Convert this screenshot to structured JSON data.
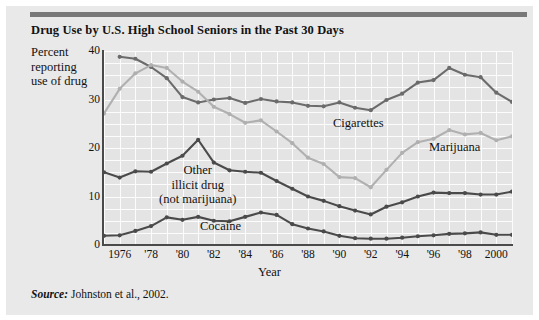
{
  "figure": {
    "title": "Drug Use by U.S. High School Seniors in the Past 30 Days",
    "source_word": "Source:",
    "source_text": " Johnston et al., 2002."
  },
  "axes": {
    "ylabel_line1": "Percent",
    "ylabel_line2": "reporting",
    "ylabel_line3": "use of drug",
    "xlabel": "Year"
  },
  "series_labels": {
    "cigarettes": "Cigarettes",
    "marijuana": "Marijuana",
    "cocaine": "Cocaine",
    "other_line1": "Other",
    "other_line2": "illicit drug",
    "other_line3": "(not marijuana)"
  },
  "colors": {
    "cigarettes": "#6b6b6b",
    "marijuana": "#b0b0b0",
    "other_illicit": "#4a4a4a",
    "cocaine": "#4a4a4a",
    "plot_background": "#e4e4e4",
    "gridline": "#fcfcfc",
    "axis": "#4a4a4a",
    "figure_background": "#e9e9e9",
    "top_rule": "#787878"
  },
  "chart_data": {
    "type": "line",
    "title": "Drug Use by U.S. High School Seniors in the Past 30 Days",
    "xlabel": "Year",
    "ylabel": "Percent reporting use of drug",
    "xlim": [
      1975,
      2001
    ],
    "ylim": [
      0,
      40
    ],
    "yticks": [
      0,
      10,
      20,
      30,
      40
    ],
    "xtick_labels": [
      "1976",
      "'78",
      "'80",
      "'82",
      "'84",
      "'86",
      "'88",
      "'90",
      "'92",
      "'94",
      "'96",
      "'98",
      "2000"
    ],
    "xtick_values": [
      1976,
      1978,
      1980,
      1982,
      1984,
      1986,
      1988,
      1990,
      1992,
      1994,
      1996,
      1998,
      2000
    ],
    "grid": true,
    "legend": "inline-annotations",
    "x": [
      1975,
      1976,
      1977,
      1978,
      1979,
      1980,
      1981,
      1982,
      1983,
      1984,
      1985,
      1986,
      1987,
      1988,
      1989,
      1990,
      1991,
      1992,
      1993,
      1994,
      1995,
      1996,
      1997,
      1998,
      1999,
      2000,
      2001
    ],
    "series": [
      {
        "name": "Cigarettes",
        "color": "#6b6b6b",
        "x": [
          1976,
          1977,
          1978,
          1979,
          1980,
          1981,
          1982,
          1983,
          1984,
          1985,
          1986,
          1987,
          1988,
          1989,
          1990,
          1991,
          1992,
          1993,
          1994,
          1995,
          1996,
          1997,
          1998,
          1999,
          2000,
          2001
        ],
        "values": [
          38.8,
          38.4,
          36.7,
          34.4,
          30.5,
          29.4,
          30.0,
          30.3,
          29.3,
          30.1,
          29.6,
          29.4,
          28.7,
          28.6,
          29.4,
          28.3,
          27.8,
          29.9,
          31.2,
          33.5,
          34.0,
          36.5,
          35.1,
          34.6,
          31.4,
          29.5
        ]
      },
      {
        "name": "Marijuana",
        "color": "#b0b0b0",
        "x": [
          1975,
          1976,
          1977,
          1978,
          1979,
          1980,
          1981,
          1982,
          1983,
          1984,
          1985,
          1986,
          1987,
          1988,
          1989,
          1990,
          1991,
          1992,
          1993,
          1994,
          1995,
          1996,
          1997,
          1998,
          1999,
          2000,
          2001
        ],
        "values": [
          27.1,
          32.2,
          35.4,
          37.1,
          36.5,
          33.7,
          31.6,
          28.5,
          27.0,
          25.2,
          25.7,
          23.4,
          21.0,
          18.0,
          16.7,
          14.0,
          13.8,
          11.9,
          15.5,
          19.0,
          21.2,
          21.9,
          23.7,
          22.8,
          23.1,
          21.6,
          22.4
        ]
      },
      {
        "name": "Other illicit drug (not marijuana)",
        "color": "#4a4a4a",
        "x": [
          1975,
          1976,
          1977,
          1978,
          1979,
          1980,
          1981,
          1982,
          1983,
          1984,
          1985,
          1986,
          1987,
          1988,
          1989,
          1990,
          1991,
          1992,
          1993,
          1994,
          1995,
          1996,
          1997,
          1998,
          1999,
          2000,
          2001
        ],
        "values": [
          15.0,
          13.9,
          15.2,
          15.1,
          16.8,
          18.4,
          21.7,
          17.0,
          15.4,
          15.1,
          14.9,
          13.2,
          11.6,
          10.0,
          9.1,
          8.0,
          7.1,
          6.3,
          7.9,
          8.8,
          10.0,
          10.8,
          10.7,
          10.7,
          10.4,
          10.4,
          11.0
        ]
      },
      {
        "name": "Cocaine",
        "color": "#4a4a4a",
        "x": [
          1975,
          1976,
          1977,
          1978,
          1979,
          1980,
          1981,
          1982,
          1983,
          1984,
          1985,
          1986,
          1987,
          1988,
          1989,
          1990,
          1991,
          1992,
          1993,
          1994,
          1995,
          1996,
          1997,
          1998,
          1999,
          2000,
          2001
        ],
        "values": [
          1.9,
          2.0,
          2.9,
          3.9,
          5.7,
          5.2,
          5.8,
          5.0,
          4.9,
          5.8,
          6.7,
          6.2,
          4.3,
          3.4,
          2.8,
          1.9,
          1.4,
          1.3,
          1.3,
          1.5,
          1.8,
          2.0,
          2.3,
          2.4,
          2.6,
          2.1,
          2.1
        ]
      }
    ]
  }
}
